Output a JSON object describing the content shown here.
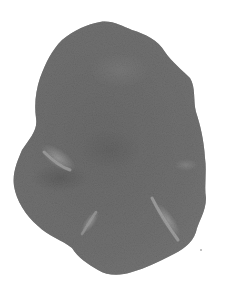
{
  "image": {
    "subject": "grayscale micrograph of an irregular lobed tissue specimen",
    "background_color": "#ffffff",
    "body_color": "#6e6e6e",
    "dark_shade": "#4a4a4a",
    "highlight_color": "#c8c8c8",
    "features": [
      {
        "name": "left-bright-ridge",
        "cx": 55,
        "cy": 160
      },
      {
        "name": "bottom-center-ridge",
        "cx": 90,
        "cy": 225
      },
      {
        "name": "bottom-right-ridge",
        "cx": 168,
        "cy": 220
      },
      {
        "name": "right-faint-ridge",
        "cx": 185,
        "cy": 165
      }
    ]
  }
}
